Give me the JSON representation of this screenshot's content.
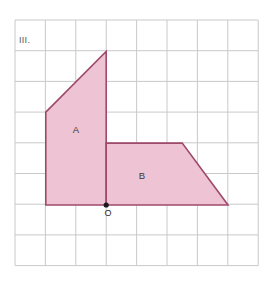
{
  "figure": {
    "panel_label": "III.",
    "origin_label": "O",
    "background_color": "#ffffff"
  },
  "grid": {
    "origin_x": 15,
    "origin_y": 20,
    "cell_w": 30.4,
    "cell_h": 30.7,
    "cols": 8,
    "rows": 8,
    "line_color": "#c9c9c9",
    "border_color": "#bdbdbd"
  },
  "style": {
    "fill_color": "#eec3d4",
    "stroke_color": "#9e4a6b",
    "stroke_width": 1.6,
    "point_color": "#1a1a1a"
  },
  "shapes": [
    {
      "name": "A",
      "label": "A",
      "label_x": 76,
      "label_y": 133,
      "points": "45.8,112.1 106.2,51.4 106.2,205.0 45.8,205.0",
      "vertices_grid": [
        [
          1,
          3
        ],
        [
          3,
          1
        ],
        [
          3,
          6
        ],
        [
          1,
          6
        ]
      ]
    },
    {
      "name": "B",
      "label": "B",
      "label_x": 142,
      "label_y": 179,
      "points": "106.2,143.1 182.2,143.1 228.0,205.0 106.2,205.0",
      "vertices_grid": [
        [
          3,
          4
        ],
        [
          5.5,
          4
        ],
        [
          7,
          6
        ],
        [
          3,
          6
        ]
      ]
    }
  ],
  "origin_point": {
    "x": 106.2,
    "y": 205.0,
    "radius": 2.6,
    "label_x": 108,
    "label_y": 216
  }
}
